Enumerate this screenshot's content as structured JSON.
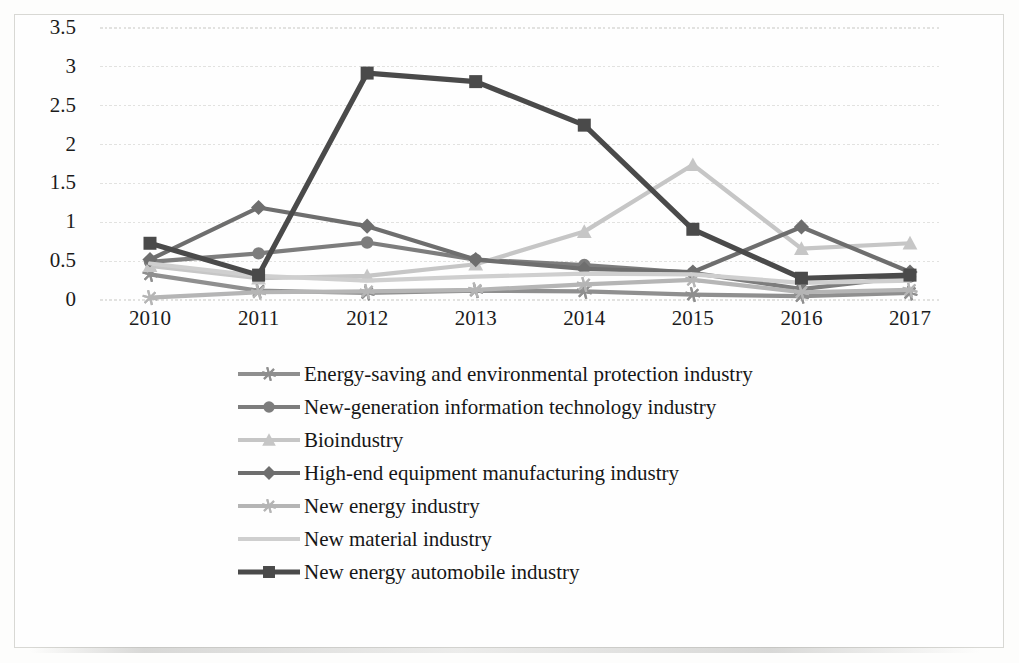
{
  "chart_data": {
    "type": "line",
    "title": "",
    "subtitle": "",
    "xlabel": "",
    "ylabel": "",
    "categories": [
      "2010",
      "2011",
      "2012",
      "2013",
      "2014",
      "2015",
      "2016",
      "2017"
    ],
    "x": [
      2010,
      2011,
      2012,
      2013,
      2014,
      2015,
      2016,
      2017
    ],
    "ylim": [
      0,
      3.5
    ],
    "yticks": [
      "0",
      "0.5",
      "1",
      "1.5",
      "2",
      "2.5",
      "3",
      "3.5"
    ],
    "ytick_values": [
      0,
      0.5,
      1,
      1.5,
      2,
      2.5,
      3,
      3.5
    ],
    "grid": true,
    "grid_axis": "y",
    "legend_position": "bottom",
    "series": [
      {
        "name": "Energy-saving and environmental protection industry",
        "marker": "asterisk",
        "color": "#8f8f8f",
        "values": [
          0.33,
          0.12,
          0.09,
          0.12,
          0.11,
          0.07,
          0.05,
          0.09
        ]
      },
      {
        "name": "New-generation information technology industry",
        "marker": "circle",
        "color": "#7d7d7d",
        "values": [
          0.49,
          0.6,
          0.74,
          0.52,
          0.45,
          0.35,
          0.14,
          0.3
        ]
      },
      {
        "name": "Bioindustry",
        "marker": "triangle",
        "color": "#c6c6c6",
        "values": [
          0.44,
          0.28,
          0.31,
          0.46,
          0.88,
          1.74,
          0.66,
          0.73
        ]
      },
      {
        "name": "High-end equipment manufacturing industry",
        "marker": "diamond",
        "color": "#6e6e6e",
        "values": [
          0.52,
          1.19,
          0.95,
          0.52,
          0.4,
          0.36,
          0.94,
          0.36
        ]
      },
      {
        "name": "New energy industry",
        "marker": "asterisk",
        "color": "#b5b5b5",
        "values": [
          0.03,
          0.1,
          0.11,
          0.13,
          0.2,
          0.26,
          0.1,
          0.13
        ]
      },
      {
        "name": "New material industry",
        "marker": "none",
        "color": "#cfcfcf",
        "values": [
          0.47,
          0.31,
          0.25,
          0.3,
          0.34,
          0.33,
          0.22,
          0.25
        ]
      },
      {
        "name": "New energy automobile industry",
        "marker": "square",
        "color": "#4a4a4a",
        "values": [
          0.73,
          0.32,
          2.92,
          2.81,
          2.25,
          0.91,
          0.28,
          0.32
        ]
      }
    ]
  },
  "axes": {
    "y_tick_labels": [
      "3.5",
      "3",
      "2.5",
      "2",
      "1.5",
      "1",
      "0.5",
      "0"
    ],
    "x_tick_labels": [
      "2010",
      "2011",
      "2012",
      "2013",
      "2014",
      "2015",
      "2016",
      "2017"
    ]
  },
  "legend": {
    "items": [
      {
        "label": "Energy-saving and environmental protection industry",
        "marker": "asterisk-marker",
        "color": "#8f8f8f"
      },
      {
        "label": "New-generation information technology industry",
        "marker": "circle-marker",
        "color": "#7d7d7d"
      },
      {
        "label": "Bioindustry",
        "marker": "triangle-marker",
        "color": "#c6c6c6"
      },
      {
        "label": "High-end equipment manufacturing industry",
        "marker": "diamond-marker",
        "color": "#6e6e6e"
      },
      {
        "label": "New energy industry",
        "marker": "asterisk-marker",
        "color": "#b5b5b5"
      },
      {
        "label": "New material industry",
        "marker": "none-marker",
        "color": "#cfcfcf"
      },
      {
        "label": "New energy automobile industry",
        "marker": "square-marker",
        "color": "#4a4a4a"
      }
    ]
  },
  "style": {
    "background": "#fdfdfc",
    "grid_color": "#e2e2e0",
    "border_color": "#d8d8d4",
    "text_color": "#1b1b1b"
  }
}
